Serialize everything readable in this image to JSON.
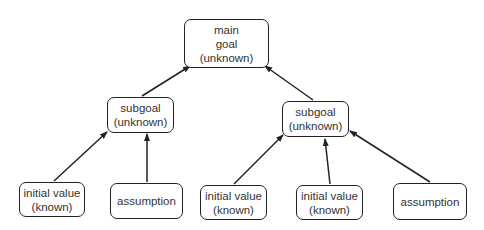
{
  "nodes": {
    "main": {
      "lines": [
        "main",
        "goal",
        "(unknown)"
      ]
    },
    "sub_left": {
      "lines": [
        "subgoal",
        "(unknown)"
      ]
    },
    "sub_right": {
      "lines": [
        "subgoal",
        "(unknown)"
      ]
    },
    "init_left": {
      "lines": [
        "initial value",
        "(known)"
      ]
    },
    "assump_left": {
      "lines": [
        "assumption"
      ]
    },
    "init_right_1": {
      "lines": [
        "initial value",
        "(known)"
      ]
    },
    "init_right_2": {
      "lines": [
        "initial value",
        "(known)"
      ]
    },
    "assump_right": {
      "lines": [
        "assumption"
      ]
    }
  },
  "colors": {
    "stroke": "#222222",
    "text": "#333333",
    "background": "#ffffff"
  }
}
